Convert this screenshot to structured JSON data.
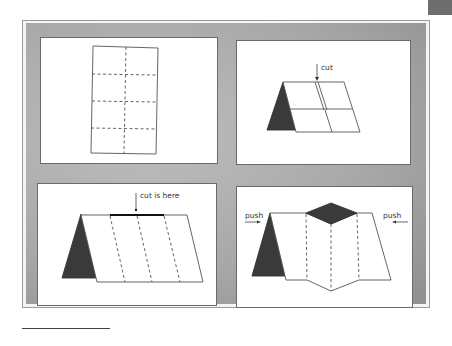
{
  "figure": {
    "panels": [
      {
        "id": "step-1",
        "description": "flat sheet with fold lines"
      },
      {
        "id": "step-2",
        "description": "folded tent with cut",
        "label": "cut"
      },
      {
        "id": "step-3",
        "description": "tent with cut location",
        "label": "cut is here"
      },
      {
        "id": "step-4",
        "description": "push ends to pop up",
        "labels": {
          "left": "push",
          "right": "push"
        }
      }
    ],
    "colors": {
      "mat": "#a9a9a9",
      "panel": "#ffffff",
      "fill_dark": "#3a3a3a",
      "line": "#555555"
    }
  }
}
